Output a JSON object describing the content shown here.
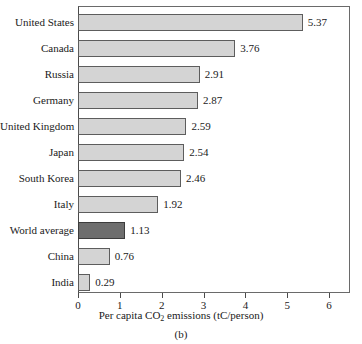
{
  "chart_data": {
    "type": "bar",
    "orientation": "horizontal",
    "title": "",
    "xlabel_parts": {
      "before": "Per capita CO",
      "sub": "2",
      "after": " emissions (tC/person)"
    },
    "xlabel": "Per capita CO2 emissions (tC/person)",
    "ylabel": "",
    "xlim": [
      0,
      6.5
    ],
    "xticks": [
      0,
      1,
      2,
      3,
      4,
      5,
      6
    ],
    "xtick_labels": [
      "0",
      "1",
      "2",
      "3",
      "4",
      "5",
      "6"
    ],
    "grid": false,
    "legend": "none",
    "categories": [
      "United States",
      "Canada",
      "Russia",
      "Germany",
      "United Kingdom",
      "Japan",
      "South Korea",
      "Italy",
      "World average",
      "China",
      "India"
    ],
    "values": [
      5.37,
      3.76,
      2.91,
      2.87,
      2.59,
      2.54,
      2.46,
      1.92,
      1.13,
      0.76,
      0.29
    ],
    "value_labels": [
      "5.37",
      "3.76",
      "2.91",
      "2.87",
      "2.59",
      "2.54",
      "2.46",
      "1.92",
      "1.13",
      "0.76",
      "0.29"
    ],
    "highlight_index": 8,
    "colors": {
      "bar_fill": "#d4d4d4",
      "bar_edge": "#5d5d5d",
      "highlight_fill": "#6e6e6e",
      "highlight_edge": "#3c3c3c",
      "axis": "#4a4a4a",
      "text": "#1a1a1a",
      "background": "#ffffff"
    }
  },
  "caption": "(b)"
}
